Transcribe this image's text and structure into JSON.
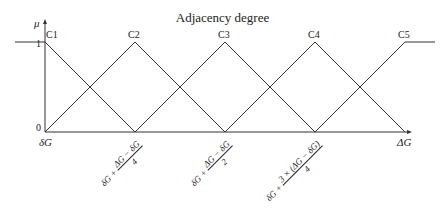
{
  "title": "Adjacency degree",
  "y_axis": {
    "label": "μ",
    "tick_top": "1",
    "tick_bottom": "0"
  },
  "x_axis": {
    "start_label": "δG",
    "end_label": "ΔG",
    "ticks": [
      {
        "prefix": "δG +",
        "num": "ΔG − δG",
        "den": "4"
      },
      {
        "prefix": "δG +",
        "num": "ΔG − δG",
        "den": "2"
      },
      {
        "prefix": "δG +",
        "num": "3 × (ΔG − δG)",
        "den": "4"
      }
    ]
  },
  "peaks": [
    "C1",
    "C2",
    "C3",
    "C4",
    "C5"
  ],
  "colors": {
    "line": "#333333"
  }
}
